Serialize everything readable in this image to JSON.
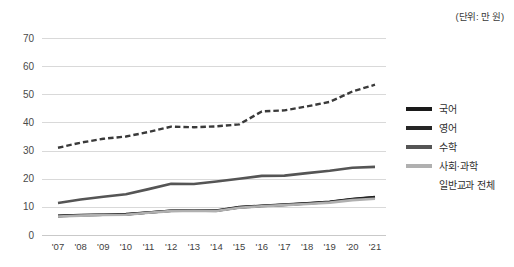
{
  "unit_note": "(단위: 만 원)",
  "legend": {
    "position": "right",
    "items": [
      {
        "label": "국어",
        "color": "#1a1a1a",
        "dashed": false
      },
      {
        "label": "영어",
        "color": "#262626",
        "dashed": false
      },
      {
        "label": "수학",
        "color": "#555555",
        "dashed": false
      },
      {
        "label": "사회·과학",
        "color": "#b0b0b0",
        "dashed": false
      },
      {
        "label": "일반교과 전체",
        "color": "#3a3a3a",
        "dashed": true
      }
    ]
  },
  "axis": {
    "y_ticks": [
      "0",
      "10",
      "20",
      "30",
      "40",
      "50",
      "60",
      "70"
    ],
    "x_ticks": [
      "'07",
      "'08",
      "'09",
      "'10",
      "'11",
      "'12",
      "'13",
      "'14",
      "'15",
      "'16",
      "'17",
      "'18",
      "'19",
      "'20",
      "'21"
    ]
  },
  "chart_data": {
    "type": "line",
    "title": "",
    "subtitle": "",
    "xlabel": "",
    "ylabel": "",
    "unit": "(단위: 만 원)",
    "ylim": [
      0,
      70
    ],
    "ytick_step": 10,
    "grid": true,
    "legend_position": "right",
    "categories": [
      "'07",
      "'08",
      "'09",
      "'10",
      "'11",
      "'12",
      "'13",
      "'14",
      "'15",
      "'16",
      "'17",
      "'18",
      "'19",
      "'20",
      "'21"
    ],
    "series": [
      {
        "name": "국어",
        "color": "#1a1a1a",
        "dashed": false,
        "values": [
          6.8,
          7.1,
          7.2,
          7.4,
          8.0,
          8.6,
          8.7,
          8.7,
          9.9,
          10.4,
          10.8,
          11.3,
          11.8,
          12.8,
          13.5
        ]
      },
      {
        "name": "영어",
        "color": "#262626",
        "dashed": false,
        "values": [
          6.7,
          7.0,
          7.2,
          7.3,
          8.0,
          8.6,
          8.7,
          8.6,
          9.8,
          10.3,
          10.7,
          11.2,
          11.7,
          12.7,
          13.4
        ]
      },
      {
        "name": "수학",
        "color": "#555555",
        "dashed": false,
        "values": [
          11.4,
          12.6,
          13.6,
          14.5,
          16.3,
          18.2,
          18.1,
          19.0,
          20.0,
          21.0,
          21.1,
          22.0,
          22.8,
          23.9,
          24.2
        ]
      },
      {
        "name": "사회·과학",
        "color": "#b0b0b0",
        "dashed": false,
        "values": [
          6.6,
          6.9,
          7.1,
          7.2,
          7.9,
          8.5,
          8.6,
          8.5,
          9.7,
          10.2,
          10.6,
          11.0,
          11.5,
          12.4,
          12.9
        ]
      },
      {
        "name": "일반교과 전체",
        "color": "#3a3a3a",
        "dashed": true,
        "values": [
          31.0,
          32.8,
          34.2,
          35.0,
          36.6,
          38.5,
          38.3,
          38.6,
          39.3,
          43.9,
          44.3,
          45.7,
          47.3,
          51.0,
          53.4
        ]
      }
    ]
  }
}
